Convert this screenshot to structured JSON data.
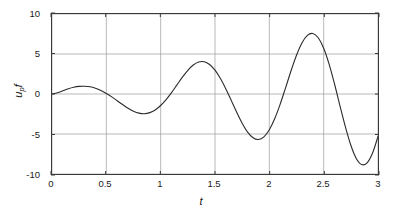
{
  "chart_data": {
    "type": "line",
    "title": "",
    "xlabel": "t",
    "ylabel": "u",
    "ylabel_sub": "p",
    "ylabel_suffix": "f",
    "ylabel_full": "u_p f",
    "xlim": [
      0,
      3
    ],
    "ylim": [
      -10,
      10
    ],
    "xticks": [
      "0",
      "0.5",
      "1",
      "1.5",
      "2",
      "2.5",
      "3"
    ],
    "xtick_values": [
      0,
      0.5,
      1,
      1.5,
      2,
      2.5,
      3
    ],
    "yticks": [
      "10",
      "5",
      "0",
      "-5",
      "-10"
    ],
    "ytick_values": [
      10,
      5,
      0,
      -5,
      -10
    ],
    "grid": true,
    "grid_color": "#9a9a9a",
    "line_color": "#2b2b2b",
    "line_width": 1.1,
    "legend": null,
    "annotations": [],
    "series": [
      {
        "name": "u_p f",
        "x": [
          0.0,
          0.05,
          0.1,
          0.15,
          0.2,
          0.25,
          0.3,
          0.35,
          0.4,
          0.45,
          0.5,
          0.55,
          0.6,
          0.65,
          0.7,
          0.75,
          0.8,
          0.85,
          0.9,
          0.95,
          1.0,
          1.05,
          1.1,
          1.15,
          1.2,
          1.25,
          1.3,
          1.35,
          1.4,
          1.45,
          1.5,
          1.55,
          1.6,
          1.65,
          1.7,
          1.75,
          1.8,
          1.85,
          1.9,
          1.95,
          2.0,
          2.05,
          2.1,
          2.15,
          2.2,
          2.25,
          2.3,
          2.35,
          2.4,
          2.45,
          2.5,
          2.55,
          2.6,
          2.65,
          2.7,
          2.75,
          2.8,
          2.85,
          2.9,
          2.95,
          3.0
        ],
        "y": [
          0.0,
          0.15,
          0.4,
          0.66,
          0.85,
          0.95,
          0.97,
          0.9,
          0.72,
          0.44,
          0.07,
          -0.36,
          -0.84,
          -1.32,
          -1.78,
          -2.15,
          -2.39,
          -2.46,
          -2.33,
          -1.99,
          -1.44,
          -0.7,
          0.18,
          1.14,
          2.1,
          2.96,
          3.62,
          4.0,
          4.03,
          3.69,
          2.98,
          1.94,
          0.64,
          -0.81,
          -2.29,
          -3.65,
          -4.76,
          -5.47,
          -5.69,
          -5.36,
          -4.47,
          -3.07,
          -1.26,
          0.8,
          2.91,
          4.84,
          6.38,
          7.33,
          7.57,
          7.03,
          5.72,
          3.73,
          1.25,
          -1.47,
          -4.12,
          -6.41,
          -8.05,
          -8.82,
          -8.6,
          -7.38,
          -5.3
        ]
      }
    ],
    "key_points": {
      "peaks": [
        {
          "t": 0.32,
          "value": 0.97
        },
        {
          "t": 1.27,
          "value": 4.03
        },
        {
          "t": 2.26,
          "value": 7.57
        }
      ],
      "troughs": [
        {
          "t": 0.79,
          "value": -2.46
        },
        {
          "t": 1.77,
          "value": -5.69
        },
        {
          "t": 2.78,
          "value": -8.82
        }
      ],
      "start": {
        "t": 0,
        "value": 0
      },
      "end": {
        "t": 3,
        "value": -5.3
      }
    }
  }
}
